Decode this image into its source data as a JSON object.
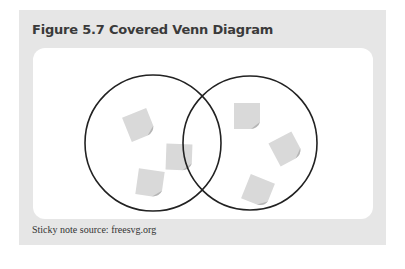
{
  "figure": {
    "title": "Figure 5.7 Covered Venn Diagram",
    "caption": "Sticky note source: freesvg.org"
  },
  "diagram": {
    "type": "venn",
    "circles": [
      {
        "name": "left-set",
        "cx": 120,
        "cy": 95,
        "r": 68
      },
      {
        "name": "right-set",
        "cx": 217,
        "cy": 95,
        "r": 67
      }
    ],
    "stroke_color": "#222222",
    "sticky_note_color": "#d9d9d9",
    "sticky_notes": [
      {
        "set": "left",
        "x": 93,
        "y": 64,
        "rot": -22
      },
      {
        "set": "left",
        "x": 133,
        "y": 96,
        "rot": 2
      },
      {
        "set": "left",
        "x": 104,
        "y": 122,
        "rot": 8
      },
      {
        "set": "right",
        "x": 201,
        "y": 55,
        "rot": 0
      },
      {
        "set": "right",
        "x": 240,
        "y": 88,
        "rot": -28
      },
      {
        "set": "right",
        "x": 212,
        "y": 130,
        "rot": 22
      }
    ]
  }
}
